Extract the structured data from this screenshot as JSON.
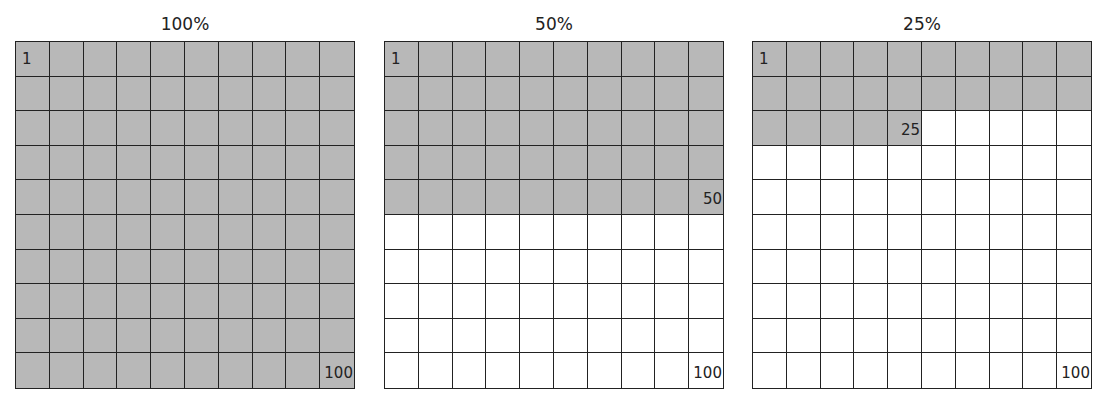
{
  "colors": {
    "filled": "#b8b8b8",
    "empty": "#ffffff",
    "line": "#222222"
  },
  "panels": [
    {
      "title": "100%",
      "filled": 100,
      "labels": [
        {
          "cell": 1,
          "text": "1",
          "pos": "tl"
        },
        {
          "cell": 100,
          "text": "100",
          "pos": "br"
        }
      ]
    },
    {
      "title": "50%",
      "filled": 50,
      "labels": [
        {
          "cell": 1,
          "text": "1",
          "pos": "tl"
        },
        {
          "cell": 50,
          "text": "50",
          "pos": "br"
        },
        {
          "cell": 100,
          "text": "100",
          "pos": "br"
        }
      ]
    },
    {
      "title": "25%",
      "filled": 25,
      "labels": [
        {
          "cell": 1,
          "text": "1",
          "pos": "tl"
        },
        {
          "cell": 25,
          "text": "25",
          "pos": "br"
        },
        {
          "cell": 100,
          "text": "100",
          "pos": "br"
        }
      ]
    }
  ]
}
